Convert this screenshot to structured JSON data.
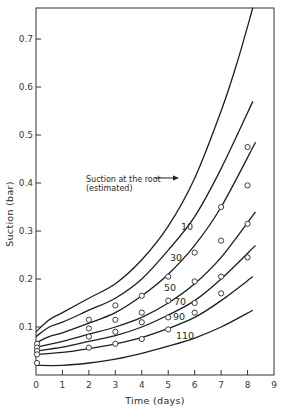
{
  "chart_data": {
    "type": "line",
    "title": "",
    "xlabel": "Time (days)",
    "ylabel": "Suction (bar)",
    "xlim": [
      0,
      9
    ],
    "ylim": [
      0,
      0.77
    ],
    "xticks": [
      0,
      1,
      2,
      3,
      4,
      5,
      6,
      7,
      8,
      9
    ],
    "xtick_labels": [
      "0",
      "1",
      "2",
      "3",
      "4",
      "5",
      "6",
      "7",
      "8",
      "9"
    ],
    "yticks": [
      0.1,
      0.2,
      0.3,
      0.4,
      0.5,
      0.6,
      0.7
    ],
    "ytick_labels": [
      "0.1",
      "0.2",
      "0.3",
      "0.4",
      "0.5",
      "0.6",
      "0.7"
    ],
    "grid": false,
    "legend": null,
    "annotations": [
      {
        "text": "Suction at the root",
        "text2": "(estimated)",
        "points_to": "root curve"
      }
    ],
    "series": [
      {
        "name": "Suction at the root (estimated)",
        "label": "",
        "x": [
          0,
          0.5,
          1,
          2,
          3,
          4,
          5,
          6,
          7,
          7.6,
          8.2
        ],
        "y": [
          0.09,
          0.115,
          0.13,
          0.16,
          0.19,
          0.24,
          0.31,
          0.41,
          0.55,
          0.65,
          0.765
        ]
      },
      {
        "name": "10",
        "label": "10",
        "x": [
          0,
          0.5,
          1,
          2,
          3,
          4,
          5,
          6,
          7,
          8.2
        ],
        "y": [
          0.08,
          0.1,
          0.11,
          0.135,
          0.16,
          0.2,
          0.26,
          0.33,
          0.43,
          0.57
        ]
      },
      {
        "name": "30",
        "label": "30",
        "x": [
          0,
          0.5,
          1,
          2,
          3,
          4,
          5,
          6,
          7,
          8.3
        ],
        "y": [
          0.067,
          0.08,
          0.088,
          0.108,
          0.13,
          0.165,
          0.21,
          0.27,
          0.35,
          0.485
        ]
      },
      {
        "name": "50",
        "label": "50",
        "x": [
          0,
          1,
          2,
          3,
          4,
          5,
          6,
          7,
          8.3
        ],
        "y": [
          0.058,
          0.07,
          0.085,
          0.1,
          0.12,
          0.15,
          0.19,
          0.245,
          0.34
        ]
      },
      {
        "name": "70",
        "label": "70",
        "x": [
          0,
          1,
          2,
          3,
          4,
          5,
          6,
          7,
          8.3
        ],
        "y": [
          0.05,
          0.058,
          0.07,
          0.082,
          0.1,
          0.125,
          0.155,
          0.2,
          0.27
        ]
      },
      {
        "name": "90",
        "label": "90",
        "x": [
          0,
          1,
          2,
          3,
          4,
          5,
          6,
          7,
          8.2
        ],
        "y": [
          0.043,
          0.047,
          0.055,
          0.065,
          0.078,
          0.097,
          0.12,
          0.155,
          0.205
        ]
      },
      {
        "name": "110",
        "label": "110",
        "x": [
          0,
          1,
          2,
          3,
          4,
          5,
          6,
          7,
          8.2
        ],
        "y": [
          0.02,
          0.02,
          0.025,
          0.033,
          0.045,
          0.06,
          0.077,
          0.1,
          0.135
        ]
      }
    ],
    "observed_points": {
      "marker": "open-circle",
      "x": [
        0,
        0,
        0,
        0,
        0,
        2,
        2,
        2,
        2,
        3,
        3,
        3,
        3,
        4,
        4,
        4,
        4,
        5,
        5,
        5,
        5,
        6,
        6,
        6,
        6,
        7,
        7,
        7,
        7,
        8,
        8,
        8,
        8
      ],
      "y": [
        0.065,
        0.057,
        0.05,
        0.043,
        0.025,
        0.115,
        0.097,
        0.08,
        0.057,
        0.145,
        0.115,
        0.09,
        0.065,
        0.165,
        0.13,
        0.11,
        0.075,
        0.205,
        0.155,
        0.12,
        0.095,
        0.255,
        0.195,
        0.15,
        0.13,
        0.35,
        0.28,
        0.205,
        0.17,
        0.475,
        0.395,
        0.315,
        0.245
      ]
    }
  },
  "labels": {
    "xlabel": "Time (days)",
    "ylabel": "Suction (bar)",
    "annotation_line1": "Suction at the root",
    "annotation_line2": "(estimated)",
    "curve_10": "10",
    "curve_30": "30",
    "curve_50": "50",
    "curve_70": "70",
    "curve_90": "90",
    "curve_110": "110"
  }
}
